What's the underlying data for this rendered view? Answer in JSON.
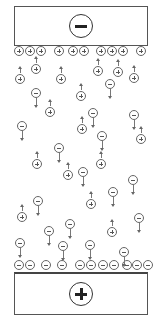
{
  "diagram": {
    "title": "",
    "top_electrode": {
      "charge": "negative",
      "symbol": "minus-icon"
    },
    "bottom_electrode": {
      "charge": "positive",
      "symbol": "plus-icon"
    },
    "adsorbed_layer_top": {
      "charge": "positive",
      "x": [
        19,
        30,
        41,
        59,
        73,
        84,
        101,
        112,
        123,
        141
      ],
      "y": 51
    },
    "adsorbed_layer_bottom": {
      "charge": "negative",
      "x": [
        19,
        30,
        46,
        62,
        80,
        91,
        103,
        114,
        127,
        137,
        148
      ],
      "y": 265
    },
    "free_ions": [
      {
        "charge": "positive",
        "x": 36,
        "y": 69,
        "arrow": "up"
      },
      {
        "charge": "positive",
        "x": 20,
        "y": 79,
        "arrow": "up"
      },
      {
        "charge": "positive",
        "x": 61,
        "y": 79,
        "arrow": "up"
      },
      {
        "charge": "positive",
        "x": 98,
        "y": 71,
        "arrow": "up"
      },
      {
        "charge": "positive",
        "x": 118,
        "y": 72,
        "arrow": "up"
      },
      {
        "charge": "positive",
        "x": 134,
        "y": 78,
        "arrow": "up"
      },
      {
        "charge": "negative",
        "x": 110,
        "y": 84,
        "arrow": "down"
      },
      {
        "charge": "negative",
        "x": 36,
        "y": 93,
        "arrow": "down"
      },
      {
        "charge": "positive",
        "x": 81,
        "y": 96,
        "arrow": "up"
      },
      {
        "charge": "positive",
        "x": 50,
        "y": 112,
        "arrow": "up"
      },
      {
        "charge": "negative",
        "x": 93,
        "y": 113,
        "arrow": "down"
      },
      {
        "charge": "negative",
        "x": 134,
        "y": 115,
        "arrow": "down"
      },
      {
        "charge": "negative",
        "x": 22,
        "y": 126,
        "arrow": "down"
      },
      {
        "charge": "positive",
        "x": 82,
        "y": 129,
        "arrow": "up"
      },
      {
        "charge": "negative",
        "x": 102,
        "y": 136,
        "arrow": "down"
      },
      {
        "charge": "positive",
        "x": 141,
        "y": 139,
        "arrow": "up"
      },
      {
        "charge": "negative",
        "x": 59,
        "y": 148,
        "arrow": "down"
      },
      {
        "charge": "positive",
        "x": 37,
        "y": 164,
        "arrow": "up"
      },
      {
        "charge": "positive",
        "x": 101,
        "y": 164,
        "arrow": "up"
      },
      {
        "charge": "positive",
        "x": 68,
        "y": 175,
        "arrow": "up"
      },
      {
        "charge": "negative",
        "x": 83,
        "y": 172,
        "arrow": "down"
      },
      {
        "charge": "negative",
        "x": 133,
        "y": 180,
        "arrow": "down"
      },
      {
        "charge": "negative",
        "x": 113,
        "y": 192,
        "arrow": "down"
      },
      {
        "charge": "positive",
        "x": 91,
        "y": 204,
        "arrow": "up"
      },
      {
        "charge": "negative",
        "x": 38,
        "y": 201,
        "arrow": "down"
      },
      {
        "charge": "positive",
        "x": 22,
        "y": 217,
        "arrow": "up"
      },
      {
        "charge": "negative",
        "x": 70,
        "y": 224,
        "arrow": "down"
      },
      {
        "charge": "negative",
        "x": 49,
        "y": 231,
        "arrow": "down"
      },
      {
        "charge": "negative",
        "x": 139,
        "y": 218,
        "arrow": "down"
      },
      {
        "charge": "positive",
        "x": 112,
        "y": 232,
        "arrow": "up"
      },
      {
        "charge": "negative",
        "x": 20,
        "y": 243,
        "arrow": "down"
      },
      {
        "charge": "negative",
        "x": 63,
        "y": 246,
        "arrow": "down"
      },
      {
        "charge": "negative",
        "x": 90,
        "y": 245,
        "arrow": "down"
      },
      {
        "charge": "negative",
        "x": 124,
        "y": 252,
        "arrow": "down"
      }
    ]
  }
}
